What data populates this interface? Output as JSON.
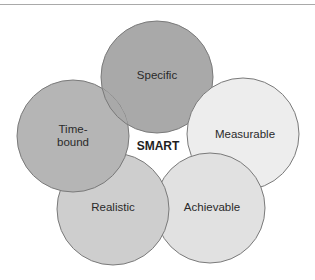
{
  "diagram": {
    "type": "overlapping-circles",
    "center_label": "SMART",
    "circles": [
      {
        "key": "specific",
        "label": "Specific",
        "fill": "#a9a9a9",
        "cx": 157,
        "cy": 77,
        "r": 56
      },
      {
        "key": "measurable",
        "label": "Measurable",
        "fill": "#ededed",
        "cx": 243,
        "cy": 134,
        "r": 56
      },
      {
        "key": "achievable",
        "label": "Achievable",
        "fill": "#e1e1e1",
        "cx": 210,
        "cy": 208,
        "r": 55
      },
      {
        "key": "realistic",
        "label": "Realistic",
        "fill": "#cecece",
        "cx": 113,
        "cy": 209,
        "r": 56
      },
      {
        "key": "timebound",
        "label_line1": "Time-",
        "label_line2": "bound",
        "fill": "#b5b5b5",
        "cx": 73,
        "cy": 136,
        "r": 56
      }
    ],
    "stroke": "#7a7a7a"
  }
}
